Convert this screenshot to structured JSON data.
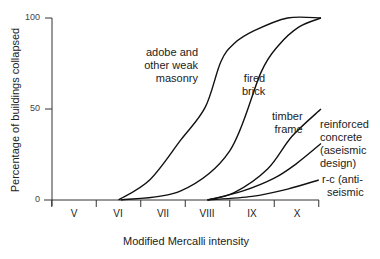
{
  "chart_data": {
    "type": "line",
    "title": "",
    "xlabel": "Modified Mercalli intensity",
    "ylabel": "Percentage of buildings collapsed",
    "x_tick_labels": [
      "V",
      "VI",
      "VII",
      "VIII",
      "IX",
      "X"
    ],
    "y_tick_labels": [
      "0",
      "50",
      "100"
    ],
    "ylim": [
      0,
      100
    ],
    "xlim": [
      4.5,
      10.5
    ],
    "grid": false,
    "legend": "inline labels",
    "series": [
      {
        "name": "adobe and other weak masonry",
        "label_lines": [
          "adobe and",
          "other weak",
          "masonry"
        ],
        "x": [
          6.0,
          6.7,
          7.4,
          7.95,
          8.3,
          8.6,
          9.05,
          9.8,
          10.55
        ],
        "y": [
          0,
          11,
          33,
          51,
          76,
          86,
          93,
          100,
          100
        ]
      },
      {
        "name": "fired brick",
        "label_lines": [
          "fired",
          "brick"
        ],
        "x": [
          6.05,
          7.4,
          8.5,
          9.2,
          9.6,
          10.05,
          10.55
        ],
        "y": [
          0,
          5,
          27,
          70,
          85,
          95,
          100
        ]
      },
      {
        "name": "timber frame",
        "label_lines": [
          "timber",
          "frame"
        ],
        "x": [
          8.0,
          8.6,
          9.35,
          9.9,
          10.55
        ],
        "y": [
          0,
          4,
          17,
          35,
          50
        ]
      },
      {
        "name": "reinforced concrete (aseismic design)",
        "label_lines": [
          "reinforced",
          "concrete",
          "(aseismic",
          "design)"
        ],
        "x": [
          8.0,
          8.8,
          9.5,
          10.0,
          10.55
        ],
        "y": [
          0,
          5,
          12,
          20,
          31
        ]
      },
      {
        "name": "r-c (anti-seismic",
        "label_lines": [
          "r-c (anti-",
          "seismic"
        ],
        "x": [
          8.0,
          9.0,
          9.8,
          10.5
        ],
        "y": [
          0,
          2,
          6,
          11
        ]
      }
    ]
  }
}
